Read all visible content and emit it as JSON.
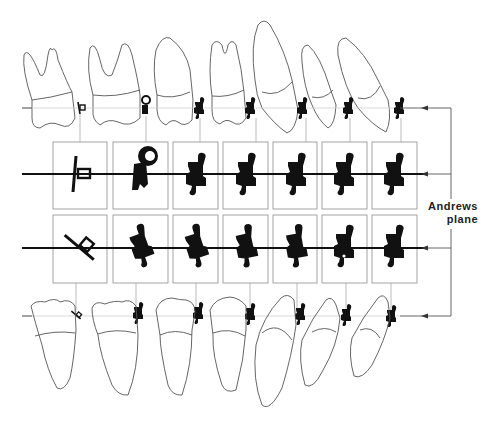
{
  "label": {
    "line1": "Andrews",
    "line2": "plane"
  },
  "colors": {
    "ink": "#111111",
    "outline": "#555555",
    "box": "#9a9a9a",
    "guide": "#bdbdbd"
  },
  "upper_teeth": [
    {
      "name": "upper-second-molar",
      "bracket": "tube"
    },
    {
      "name": "upper-first-molar",
      "bracket": "tube-hook"
    },
    {
      "name": "upper-second-premolar",
      "bracket": "twin"
    },
    {
      "name": "upper-first-premolar",
      "bracket": "twin"
    },
    {
      "name": "upper-canine",
      "bracket": "twin"
    },
    {
      "name": "upper-lateral-incisor",
      "bracket": "twin"
    },
    {
      "name": "upper-central-incisor",
      "bracket": "twin"
    }
  ],
  "lower_teeth": [
    {
      "name": "lower-second-molar",
      "bracket": "tube"
    },
    {
      "name": "lower-first-molar",
      "bracket": "twin"
    },
    {
      "name": "lower-second-premolar",
      "bracket": "twin"
    },
    {
      "name": "lower-first-premolar",
      "bracket": "twin"
    },
    {
      "name": "lower-canine",
      "bracket": "twin"
    },
    {
      "name": "lower-lateral-incisor",
      "bracket": "twin"
    },
    {
      "name": "lower-central-incisor",
      "bracket": "twin"
    }
  ]
}
